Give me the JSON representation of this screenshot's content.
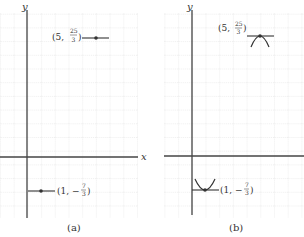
{
  "figure": {
    "panels": [
      {
        "id": "a",
        "caption": "(a)",
        "axis_labels": {
          "x": "x",
          "y": "y"
        },
        "points": [
          {
            "label_prefix": "(5, ",
            "frac_num": "25",
            "frac_den": "3",
            "label_suffix": ")",
            "x": 5,
            "y": 8.333,
            "marker": "horizontal-tangent"
          },
          {
            "label_prefix": "(1, −",
            "frac_num": "7",
            "frac_den": "3",
            "label_suffix": ")",
            "x": 1,
            "y": -2.333,
            "marker": "horizontal-tangent"
          }
        ]
      },
      {
        "id": "b",
        "caption": "(b)",
        "axis_labels": {
          "y": "y"
        },
        "points": [
          {
            "label_prefix": "(5, ",
            "frac_num": "25",
            "frac_den": "3",
            "label_suffix": ")",
            "x": 5,
            "y": 8.333,
            "marker": "local-maximum"
          },
          {
            "label_prefix": "(1, −",
            "frac_num": "7",
            "frac_den": "3",
            "label_suffix": ")",
            "x": 1,
            "y": -2.333,
            "marker": "local-minimum"
          }
        ]
      }
    ]
  },
  "colors": {
    "grid": "#d8d8d8",
    "axis": "#444444",
    "curve": "#333333"
  }
}
